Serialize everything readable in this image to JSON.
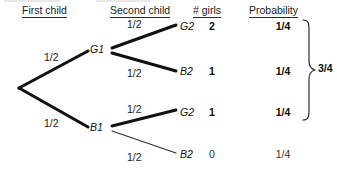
{
  "diagram": {
    "type": "probability-tree",
    "headers": [
      {
        "label": "First child",
        "x": 22,
        "y": 4
      },
      {
        "label": "Second child",
        "x": 110,
        "y": 4
      },
      {
        "label": "# girls",
        "x": 193,
        "y": 4
      },
      {
        "label": "Probability",
        "x": 249,
        "y": 4
      }
    ],
    "root": {
      "x": 18,
      "y": 88
    },
    "nodes": [
      {
        "id": "G1",
        "label": "G1",
        "x": 93,
        "y": 50,
        "level": 1
      },
      {
        "id": "B1",
        "label": "B1",
        "x": 93,
        "y": 128,
        "level": 1
      },
      {
        "id": "G2a",
        "label": "G2",
        "x": 183,
        "y": 27,
        "level": 2
      },
      {
        "id": "B2a",
        "label": "B2",
        "x": 183,
        "y": 72,
        "level": 2
      },
      {
        "id": "G2b",
        "label": "G2",
        "x": 183,
        "y": 113,
        "level": 2
      },
      {
        "id": "B2b",
        "label": "B2",
        "x": 183,
        "y": 155,
        "level": 2
      }
    ],
    "edges": [
      {
        "from": "root",
        "to": "G1",
        "probability": "1/2",
        "label_x": 44,
        "label_y": 52,
        "weight": "heavy"
      },
      {
        "from": "root",
        "to": "B1",
        "probability": "1/2",
        "label_x": 44,
        "label_y": 118,
        "weight": "heavy"
      },
      {
        "from": "G1",
        "to": "G2a",
        "probability": "1/2",
        "label_x": 127,
        "label_y": 19,
        "weight": "heavy"
      },
      {
        "from": "G1",
        "to": "B2a",
        "probability": "1/2",
        "label_x": 127,
        "label_y": 68,
        "weight": "heavy"
      },
      {
        "from": "B1",
        "to": "G2b",
        "probability": "1/2",
        "label_x": 127,
        "label_y": 104,
        "weight": "heavy"
      },
      {
        "from": "B1",
        "to": "B2b",
        "probability": "1/2",
        "label_x": 127,
        "label_y": 152,
        "weight": "light"
      }
    ],
    "outcomes": [
      {
        "outcome": "G2",
        "girls": "2",
        "probability": "1/4",
        "y": 27,
        "emphasis": "bold"
      },
      {
        "outcome": "B2",
        "girls": "1",
        "probability": "1/4",
        "y": 72,
        "emphasis": "bold"
      },
      {
        "outcome": "G2",
        "girls": "1",
        "probability": "1/4",
        "y": 113,
        "emphasis": "bold"
      },
      {
        "outcome": "B2",
        "girls": "0",
        "probability": "1/4",
        "y": 155,
        "emphasis": "plain"
      }
    ],
    "brace": {
      "total": "3/4",
      "covers_rows": 3,
      "top": 22,
      "bottom": 118,
      "label_x": 320,
      "label_y": 63
    },
    "columns": {
      "girls_center_x": 212,
      "probability_center_x": 283
    },
    "colors": {
      "background": "#ffffff",
      "ink": "#000000",
      "line_heavy": "#111111",
      "line_light": "#2b2b2b",
      "rule": "#2b2b2b"
    }
  }
}
